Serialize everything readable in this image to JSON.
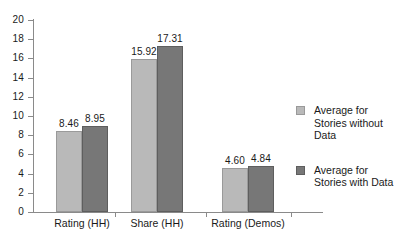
{
  "chart_data": {
    "type": "bar",
    "title": "",
    "xlabel": "",
    "ylabel": "",
    "ylim": [
      0,
      20
    ],
    "ytick_step": 2,
    "yticks": [
      "20",
      "18",
      "16",
      "14",
      "12",
      "10",
      "8",
      "6",
      "4",
      "2",
      "0"
    ],
    "grid": false,
    "legend_position": "right",
    "categories": [
      "Rating (HH)",
      "Share (HH)",
      "Rating (Demos)"
    ],
    "series": [
      {
        "name": "Average for\nStories without\nData",
        "color": "#b9b9b9",
        "values": [
          8.46,
          15.92,
          4.6
        ],
        "value_labels": [
          "8.46",
          "15.92",
          "4.60"
        ]
      },
      {
        "name": "Average for\nStories with Data",
        "color": "#777777",
        "values": [
          8.95,
          17.31,
          4.84
        ],
        "value_labels": [
          "8.95",
          "17.31",
          "4.84"
        ]
      }
    ]
  },
  "legend": {
    "entries": [
      {
        "label": "Average for\nStories without\nData",
        "swatch": "light-gray-swatch"
      },
      {
        "label": "Average for\nStories with Data",
        "swatch": "dark-gray-swatch"
      }
    ]
  },
  "colors": {
    "series_light": "#b9b9b9",
    "series_dark": "#777777",
    "axis": "#8a8a8a",
    "text": "#1a1a1a",
    "background": "#ffffff"
  }
}
